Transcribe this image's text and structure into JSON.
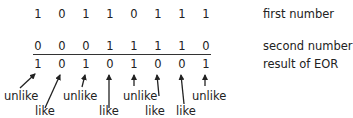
{
  "rows": [
    {
      "name": "first-number",
      "label": "first number",
      "bits": [
        "1",
        "0",
        "1",
        "1",
        "0",
        "1",
        "1",
        "1"
      ]
    },
    {
      "name": "second-number",
      "label": "second number",
      "bits": [
        "0",
        "0",
        "0",
        "1",
        "1",
        "1",
        "1",
        "0"
      ]
    },
    {
      "name": "result",
      "label": "result of EOR",
      "bits": [
        "1",
        "0",
        "1",
        "0",
        "1",
        "0",
        "0",
        "1"
      ]
    }
  ],
  "annotations": {
    "unlike": "unlike",
    "like": "like",
    "bits": [
      {
        "bit": 0,
        "label": "unlike"
      },
      {
        "bit": 1,
        "label": "like"
      },
      {
        "bit": 2,
        "label": "unlike"
      },
      {
        "bit": 3,
        "label": "like"
      },
      {
        "bit": 4,
        "label": "unlike"
      },
      {
        "bit": 5,
        "label": "like"
      },
      {
        "bit": 6,
        "label": "like"
      },
      {
        "bit": 7,
        "label": "unlike"
      }
    ]
  }
}
